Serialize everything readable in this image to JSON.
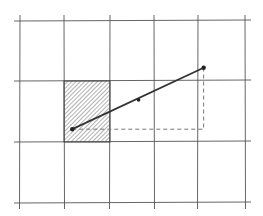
{
  "diagram": {
    "grid": {
      "columns": 5,
      "rows": 3
    },
    "hatched_cell": {
      "col": 1,
      "row": 1
    },
    "segment": {
      "start": {
        "col": 1.18,
        "row": 1.79
      },
      "mid": {
        "col": 2.65,
        "row": 1.31
      },
      "end": {
        "col": 4.12,
        "row": 0.78
      }
    },
    "dashed_path": {
      "corner": {
        "col": 4.12,
        "row": 1.79
      }
    },
    "colors": {
      "grid": "#555555",
      "segment": "#333333",
      "hatch": "#666666",
      "dashed": "#777777"
    }
  }
}
